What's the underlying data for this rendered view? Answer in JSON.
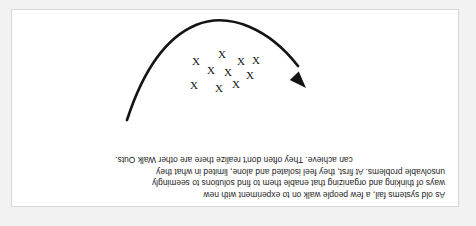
{
  "figure": {
    "background_color": "#f2f2f2",
    "frame_color": "#ffffff",
    "frame_border_color": "#d6d6d6",
    "ink_color": "#141414",
    "orientation": "rotated-180",
    "caption": {
      "lines": [
        "As old systems fail, a few people walk on to experiment with new",
        "ways of thinking and organizing that enable them to find solutions to seemingly",
        "unsolvable problems. At first, they feel isolated and alone, limited in what they",
        "can achieve. They often don't realize there are other Walk Outs."
      ]
    },
    "diagram": {
      "arrow_label": "u-shaped-curve-with-arrow",
      "arrow_direction": "up-left",
      "x_marks_symbol": "X",
      "x_marks_count": 10,
      "x_marks": [
        {
          "x": 208,
          "y": 131
        },
        {
          "x": 222,
          "y": 122
        },
        {
          "x": 239,
          "y": 118
        },
        {
          "x": 264,
          "y": 121
        },
        {
          "x": 230,
          "y": 134
        },
        {
          "x": 247,
          "y": 136
        },
        {
          "x": 202,
          "y": 146
        },
        {
          "x": 217,
          "y": 145
        },
        {
          "x": 236,
          "y": 152
        },
        {
          "x": 262,
          "y": 145
        }
      ],
      "curve_path": "M 331 86 C 318 126, 298 166, 262 181 C 228 195, 188 176, 160 140",
      "arrow_tip": {
        "x": 152,
        "y": 118
      }
    }
  }
}
